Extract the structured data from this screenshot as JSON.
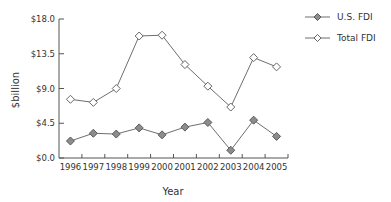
{
  "chart_data": {
    "type": "line",
    "title": "",
    "xlabel": "Year",
    "ylabel": "$billion",
    "x": [
      "1996",
      "1997",
      "1998",
      "1999",
      "2000",
      "2001",
      "2002",
      "2003",
      "2004",
      "2005"
    ],
    "y_ticks": [
      "$0.0",
      "$4.5",
      "$9.0",
      "$13.5",
      "$18.0"
    ],
    "ylim": [
      0,
      18
    ],
    "grid": false,
    "legend_position": "right-top",
    "series": [
      {
        "name": "U.S. FDI",
        "marker": "filled-diamond",
        "values": [
          2.2,
          3.2,
          3.1,
          3.9,
          3.0,
          4.0,
          4.6,
          1.0,
          4.9,
          2.8
        ]
      },
      {
        "name": "Total FDI",
        "marker": "open-diamond",
        "values": [
          7.6,
          7.2,
          9.0,
          15.8,
          15.9,
          12.1,
          9.3,
          6.6,
          13.0,
          11.8
        ]
      }
    ]
  },
  "colors": {
    "line": "#6e6e6e",
    "axis": "#555555",
    "filled_marker": "#8c8c8c",
    "filled_marker_stroke": "#5a5a5a",
    "open_marker_fill": "#ffffff",
    "open_marker_stroke": "#666666"
  }
}
